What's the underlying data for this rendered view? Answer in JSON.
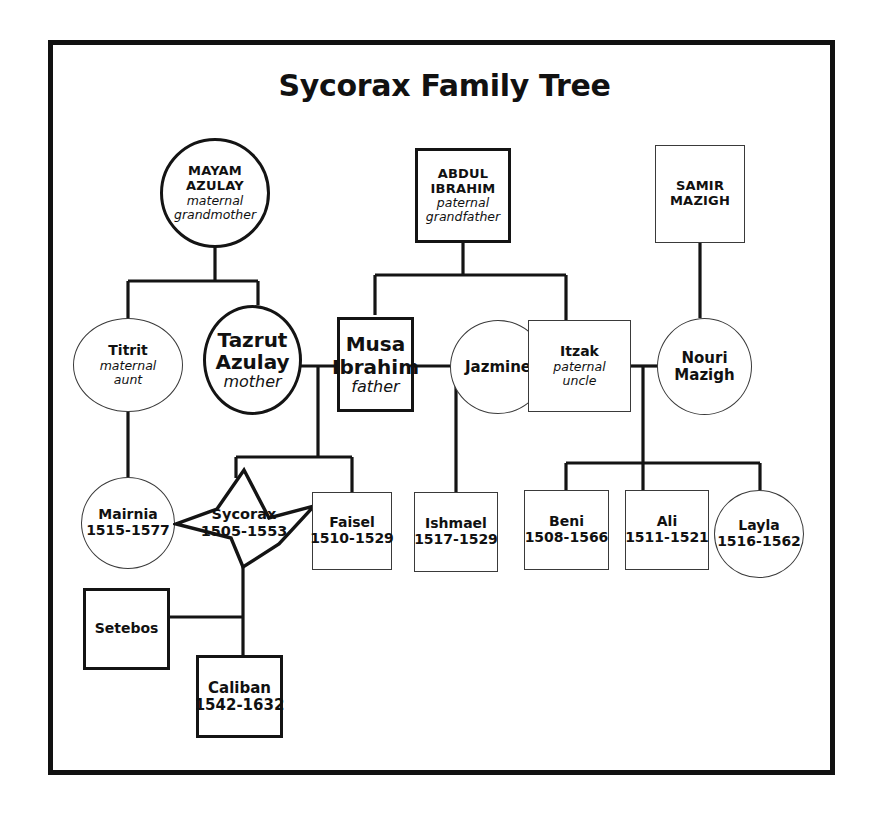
{
  "title": "Sycorax Family Tree",
  "nodes": {
    "mayam": {
      "name": "MAYAM\nAZULAY",
      "line1": "MAYAM",
      "line2": "AZULAY",
      "relation": "maternal\ngrandmother",
      "rel1": "maternal",
      "rel2": "grandmother"
    },
    "abdul": {
      "line1": "ABDUL",
      "line2": "IBRAHIM",
      "rel1": "paternal",
      "rel2": "grandfather"
    },
    "samir": {
      "line1": "SAMIR",
      "line2": "MAZIGH"
    },
    "titrit": {
      "line1": "Titrit",
      "rel1": "maternal",
      "rel2": "aunt"
    },
    "tazrut": {
      "line1": "Tazrut",
      "line2": "Azulay",
      "rel1": "mother"
    },
    "musa": {
      "line1": "Musa",
      "line2": "Ibrahim",
      "rel1": "father"
    },
    "jazmine": {
      "line1": "Jazmine"
    },
    "itzak": {
      "line1": "Itzak",
      "rel1": "paternal",
      "rel2": "uncle"
    },
    "nouri": {
      "line1": "Nouri",
      "line2": "Mazigh"
    },
    "mairnia": {
      "line1": "Mairnia",
      "dates": "1515-1577"
    },
    "sycorax": {
      "line1": "Sycorax",
      "dates": "1505-1553"
    },
    "faisel": {
      "line1": "Faisel",
      "dates": "1510-1529"
    },
    "ishmael": {
      "line1": "Ishmael",
      "dates": "1517-1529"
    },
    "beni": {
      "line1": "Beni",
      "dates": "1508-1566"
    },
    "ali": {
      "line1": "Ali",
      "dates": "1511-1521"
    },
    "layla": {
      "line1": "Layla",
      "dates": "1516-1562"
    },
    "setebos": {
      "line1": "Setebos"
    },
    "caliban": {
      "line1": "Caliban",
      "dates": "1542-1632"
    }
  },
  "colors": {
    "ink": "#111111",
    "line_thick": "#141414",
    "line_thin": "#3a3a3a",
    "background": "#ffffff"
  }
}
